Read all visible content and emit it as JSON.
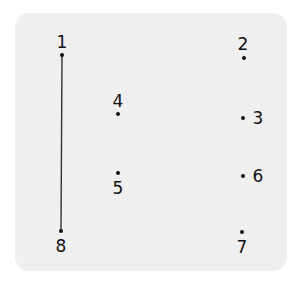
{
  "puzzle": {
    "type": "connect-the-dots",
    "background_color": "#efefef",
    "dot_color": "#111111",
    "line_color": "#333333",
    "points": [
      {
        "label": "1",
        "dot": [
          62,
          55
        ],
        "label_pos": [
          62,
          42
        ]
      },
      {
        "label": "2",
        "dot": [
          244,
          58
        ],
        "label_pos": [
          243,
          44
        ]
      },
      {
        "label": "3",
        "dot": [
          243,
          118
        ],
        "label_pos": [
          258,
          118
        ]
      },
      {
        "label": "4",
        "dot": [
          118,
          114
        ],
        "label_pos": [
          118,
          101
        ]
      },
      {
        "label": "5",
        "dot": [
          118,
          173
        ],
        "label_pos": [
          118,
          188
        ]
      },
      {
        "label": "6",
        "dot": [
          243,
          176
        ],
        "label_pos": [
          258,
          176
        ]
      },
      {
        "label": "7",
        "dot": [
          242,
          232
        ],
        "label_pos": [
          242,
          247
        ]
      },
      {
        "label": "8",
        "dot": [
          61,
          231
        ],
        "label_pos": [
          61,
          246
        ]
      }
    ],
    "drawn_lines": [
      {
        "from": "1",
        "to": "8"
      }
    ]
  }
}
